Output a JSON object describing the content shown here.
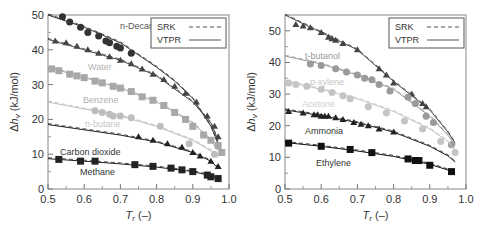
{
  "chart_data": [
    {
      "type": "scatter",
      "title": "",
      "xlabel": "T_r (–)",
      "ylabel": "Δh_v (kJ/mol)",
      "xlim": [
        0.5,
        1.0
      ],
      "ylim": [
        0,
        50
      ],
      "xticks": [
        "0.5",
        "0.6",
        "0.7",
        "0.8",
        "0.9",
        "1.0"
      ],
      "yticks": [
        "0",
        "10",
        "20",
        "30",
        "40",
        "50"
      ],
      "legend": {
        "position": "upper right",
        "entries": [
          {
            "label": "SRK",
            "style": "dashed"
          },
          {
            "label": "VTPR",
            "style": "solid"
          }
        ]
      },
      "series": [
        {
          "name": "n-Decane",
          "marker": "circle",
          "color": "#333333",
          "x": [
            0.54,
            0.56,
            0.59,
            0.61,
            0.64,
            0.66,
            0.67,
            0.69,
            0.7,
            0.73
          ],
          "y": [
            49.5,
            48,
            46.5,
            45,
            44,
            42.5,
            42,
            41,
            40.5,
            39
          ],
          "curve_x": [
            0.5,
            0.6,
            0.7,
            0.8,
            0.85,
            0.9,
            0.95,
            0.97
          ],
          "curve_y": [
            50,
            46.5,
            42,
            35,
            31,
            26,
            18,
            13
          ]
        },
        {
          "name": "Water",
          "marker": "triangle",
          "color": "#444444",
          "x": [
            0.52,
            0.55,
            0.58,
            0.61,
            0.64,
            0.67,
            0.7,
            0.73,
            0.76,
            0.79,
            0.82,
            0.85,
            0.88,
            0.91,
            0.94,
            0.96,
            0.97
          ],
          "y": [
            42.5,
            42,
            41,
            40,
            39,
            38,
            37,
            36,
            34.5,
            33,
            31.5,
            29.5,
            27.5,
            25,
            21,
            18,
            15
          ],
          "curve_x": [
            0.5,
            0.6,
            0.7,
            0.8,
            0.9,
            0.95,
            0.97
          ],
          "curve_y": [
            43,
            40,
            37,
            32.5,
            25,
            19,
            14
          ]
        },
        {
          "name": "Benzene",
          "marker": "square",
          "color": "#a8a8a8",
          "x": [
            0.51,
            0.53,
            0.56,
            0.58,
            0.6,
            0.63,
            0.65,
            0.68,
            0.7,
            0.73,
            0.76,
            0.79,
            0.82,
            0.85,
            0.88,
            0.9,
            0.93,
            0.95,
            0.97,
            0.98
          ],
          "y": [
            34.5,
            34,
            33,
            32.5,
            32,
            31,
            30.5,
            29.5,
            29,
            28,
            26.5,
            25.5,
            24,
            22,
            20,
            18,
            15.5,
            14,
            12.5,
            10.5
          ],
          "curve_x": [
            0.5,
            0.6,
            0.7,
            0.8,
            0.9,
            0.95,
            0.97
          ],
          "curve_y": [
            35,
            32,
            29,
            25,
            19,
            14,
            11
          ]
        },
        {
          "name": "n-butane",
          "marker": "circle",
          "color": "#bdbdbd",
          "x": [
            0.63,
            0.65,
            0.67,
            0.68,
            0.7,
            0.73,
            0.81,
            0.89,
            0.96
          ],
          "y": [
            22.5,
            22,
            21.5,
            21,
            21,
            20.5,
            18,
            13,
            10
          ],
          "curve_x": [
            0.5,
            0.6,
            0.7,
            0.8,
            0.9,
            0.95,
            0.97
          ],
          "curve_y": [
            25,
            23,
            21,
            18,
            14,
            11,
            9
          ]
        },
        {
          "name": "Carbon dioxide",
          "marker": "triangle",
          "color": "#222222",
          "x": [
            0.75,
            0.79,
            0.83,
            0.87,
            0.9,
            0.92,
            0.95,
            0.97
          ],
          "y": [
            15,
            14,
            13,
            12,
            10.5,
            9.5,
            8,
            6.5
          ],
          "curve_x": [
            0.5,
            0.6,
            0.7,
            0.8,
            0.9,
            0.95,
            0.97
          ],
          "curve_y": [
            18.5,
            17,
            15.5,
            13.5,
            10.5,
            8,
            6
          ]
        },
        {
          "name": "Methane",
          "marker": "square",
          "color": "#222222",
          "x": [
            0.53,
            0.59,
            0.63,
            0.74,
            0.79,
            0.84,
            0.87,
            0.9,
            0.94,
            0.95,
            0.97
          ],
          "y": [
            8.5,
            8,
            8,
            7,
            6.5,
            6,
            5.5,
            5,
            4,
            3.5,
            3
          ],
          "curve_x": [
            0.5,
            0.6,
            0.7,
            0.8,
            0.9,
            0.95,
            0.97
          ],
          "curve_y": [
            8.7,
            8,
            7.2,
            6.3,
            5,
            3.8,
            3
          ]
        }
      ]
    },
    {
      "type": "scatter",
      "title": "",
      "xlabel": "T_r (–)",
      "ylabel": "Δh_v (kJ/mol)",
      "xlim": [
        0.5,
        1.0
      ],
      "ylim": [
        0,
        55
      ],
      "xticks": [
        "0.5",
        "0.6",
        "0.7",
        "0.8",
        "0.9",
        "1.0"
      ],
      "yticks": [
        "0",
        "10",
        "20",
        "30",
        "40",
        "50"
      ],
      "legend": {
        "position": "upper right",
        "entries": [
          {
            "label": "SRK",
            "style": "dashed"
          },
          {
            "label": "VTPR",
            "style": "solid"
          }
        ]
      },
      "series": [
        {
          "name": "Top (unlabeled)",
          "marker": "triangle",
          "color": "#444444",
          "x": [
            0.53,
            0.55,
            0.57,
            0.6,
            0.62,
            0.63,
            0.64,
            0.66,
            0.7,
            0.76,
            0.78,
            0.8,
            0.85,
            0.88,
            0.89
          ],
          "y": [
            52,
            51.5,
            51,
            49.5,
            48,
            47.5,
            47,
            46,
            44,
            38,
            36,
            33.5,
            30,
            27,
            26
          ],
          "curve_x": [
            0.5,
            0.6,
            0.7,
            0.8,
            0.9,
            0.95,
            0.97
          ],
          "curve_y": [
            55,
            49.5,
            44,
            34,
            25,
            18,
            14.5
          ]
        },
        {
          "name": "t-butanol",
          "marker": "circle",
          "color": "#9a9a9a",
          "x": [
            0.57,
            0.6,
            0.64,
            0.67,
            0.7,
            0.72,
            0.74,
            0.76,
            0.79,
            0.84,
            0.86,
            0.89,
            0.91,
            0.96
          ],
          "y": [
            39.5,
            39,
            38,
            37,
            36,
            35,
            34.5,
            33,
            31,
            29,
            27,
            23,
            21,
            14
          ],
          "curve_x": [
            0.5,
            0.6,
            0.7,
            0.8,
            0.9,
            0.95,
            0.97
          ],
          "curve_y": [
            42,
            39.5,
            36,
            31.5,
            23,
            17,
            14
          ]
        },
        {
          "name": "p-xylene",
          "marker": "circle",
          "color": "#c4c4c4",
          "x": [
            0.51,
            0.53,
            0.56,
            0.6,
            0.63,
            0.66,
            0.68,
            0.73,
            0.78,
            0.83,
            0.88,
            0.93,
            0.97
          ],
          "y": [
            33.5,
            33,
            32.5,
            31.5,
            30.5,
            29.5,
            28.5,
            26,
            24,
            21.5,
            19,
            15,
            11.5
          ],
          "curve_x": [
            0.5,
            0.6,
            0.7,
            0.8,
            0.9,
            0.95,
            0.97
          ],
          "curve_y": [
            34,
            31.5,
            28.5,
            24.5,
            19,
            15,
            12
          ]
        },
        {
          "name": "Acetone",
          "marker": "circle",
          "color": "#d0d0d0",
          "x": [],
          "y": [],
          "curve_x": [],
          "curve_y": []
        },
        {
          "name": "Ammonia",
          "marker": "triangle",
          "color": "#222222",
          "x": [
            0.51,
            0.55,
            0.58,
            0.59,
            0.6,
            0.61,
            0.62,
            0.64,
            0.66,
            0.69,
            0.71,
            0.73,
            0.76,
            0.8
          ],
          "y": [
            24.5,
            24,
            23.5,
            23.5,
            23,
            23,
            23,
            22.5,
            22,
            21,
            20.5,
            20,
            19,
            18
          ],
          "curve_x": [
            0.5,
            0.6,
            0.7,
            0.8,
            0.9,
            0.95,
            0.97
          ],
          "curve_y": [
            25,
            23.2,
            21,
            18,
            13.5,
            10.5,
            8.5
          ]
        },
        {
          "name": "Ethylene",
          "marker": "square",
          "color": "#111111",
          "x": [
            0.51,
            0.6,
            0.68,
            0.74,
            0.84,
            0.86,
            0.87,
            0.9,
            0.96
          ],
          "y": [
            14.5,
            13.5,
            12.5,
            11.5,
            9.5,
            9,
            9,
            7.5,
            5.5
          ],
          "curve_x": [
            0.5,
            0.6,
            0.7,
            0.8,
            0.9,
            0.95,
            0.97
          ],
          "curve_y": [
            14.7,
            13.5,
            12,
            10.3,
            7.8,
            6,
            5
          ]
        }
      ]
    }
  ],
  "panels": [
    {
      "legend": {
        "srk": "SRK",
        "vtpr": "VTPR"
      },
      "labels": [
        "n-Decane",
        "Water",
        "Benzene",
        "n-butane",
        "Carbon dioxide",
        "Methane"
      ]
    },
    {
      "legend": {
        "srk": "SRK",
        "vtpr": "VTPR"
      },
      "labels": [
        "t-butanol",
        "p-xylene",
        "Acetone",
        "Ammonia",
        "Ethylene"
      ]
    }
  ]
}
